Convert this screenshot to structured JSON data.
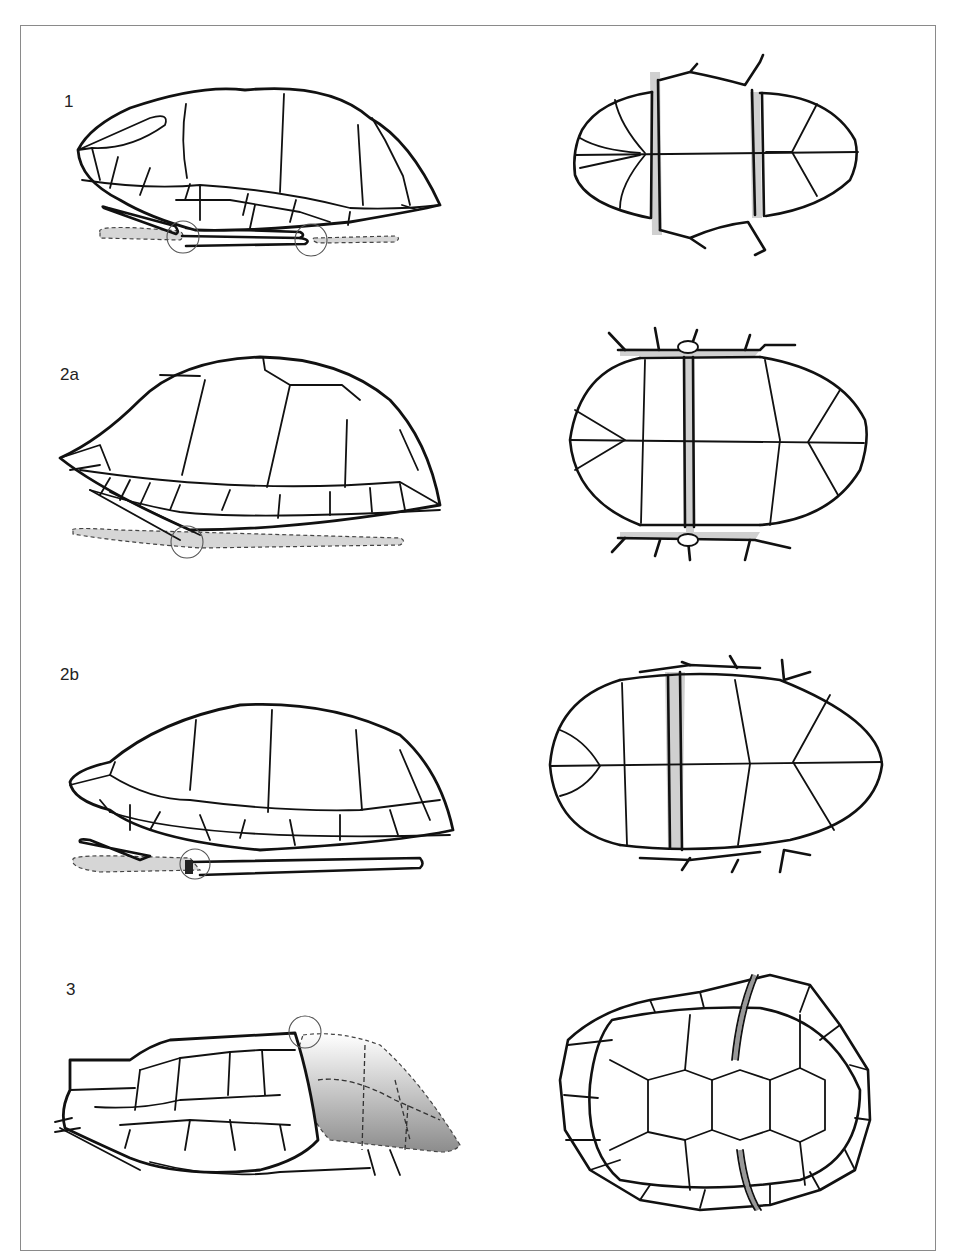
{
  "figure": {
    "panels": [
      {
        "id": "1",
        "label": "1",
        "views": [
          "lateral-view",
          "plastron-view"
        ],
        "hinges": 2
      },
      {
        "id": "2a",
        "label": "2a",
        "views": [
          "lateral-view",
          "plastron-view"
        ],
        "hinges": 1
      },
      {
        "id": "2b",
        "label": "2b",
        "views": [
          "lateral-view",
          "plastron-view"
        ],
        "hinges": 1
      },
      {
        "id": "3",
        "label": "3",
        "views": [
          "lateral-view",
          "carapace-view"
        ],
        "hinges": 1
      }
    ],
    "colors": {
      "ink": "#111111",
      "hinge_fill": "#cfcfcf",
      "frame": "#8a8a8a",
      "background": "#ffffff"
    }
  }
}
